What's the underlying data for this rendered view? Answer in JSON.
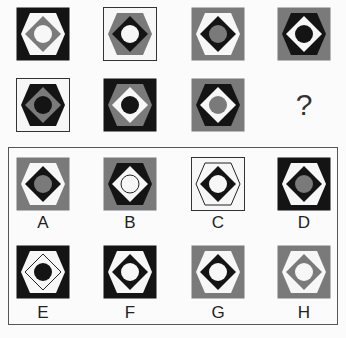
{
  "puzzle": {
    "question_mark": "?",
    "colors": {
      "black": "#141414",
      "gray": "#7a7a7a",
      "white": "#f7f7f7"
    },
    "sequence": [
      {
        "bg": "black",
        "hex": "white",
        "diamond": "gray",
        "circle": "white",
        "frame": "none"
      },
      {
        "bg": "white",
        "hex": "gray",
        "diamond": "black",
        "circle": "white",
        "frame": "outline"
      },
      {
        "bg": "gray",
        "hex": "white",
        "diamond": "black",
        "circle": "gray",
        "frame": "none"
      },
      {
        "bg": "gray",
        "hex": "black",
        "diamond": "white",
        "circle": "black",
        "frame": "none"
      },
      {
        "bg": "white",
        "hex": "black",
        "diamond": "gray",
        "circle": "black",
        "frame": "outline"
      },
      {
        "bg": "black",
        "hex": "gray",
        "diamond": "white",
        "circle": "black",
        "frame": "none"
      },
      {
        "bg": "gray",
        "hex": "black",
        "diamond": "white",
        "circle": "gray",
        "frame": "none"
      }
    ],
    "options": [
      {
        "label": "A",
        "bg": "gray",
        "hex": "white",
        "diamond": "black",
        "circle": "gray"
      },
      {
        "label": "B",
        "bg": "gray",
        "hex": "black",
        "diamond": "white",
        "circle": "white-outlined"
      },
      {
        "label": "C",
        "bg": "white",
        "hex": "white-outlined",
        "diamond": "black",
        "circle": "white"
      },
      {
        "label": "D",
        "bg": "black",
        "hex": "white",
        "diamond": "black",
        "circle": "gray"
      },
      {
        "label": "E",
        "bg": "black",
        "hex": "white",
        "diamond": "white-outlined",
        "circle": "black"
      },
      {
        "label": "F",
        "bg": "black",
        "hex": "white",
        "diamond": "black",
        "circle": "white"
      },
      {
        "label": "G",
        "bg": "gray",
        "hex": "white",
        "diamond": "black",
        "circle": "white"
      },
      {
        "label": "H",
        "bg": "gray",
        "hex": "white",
        "diamond": "gray",
        "circle": "white"
      }
    ]
  }
}
